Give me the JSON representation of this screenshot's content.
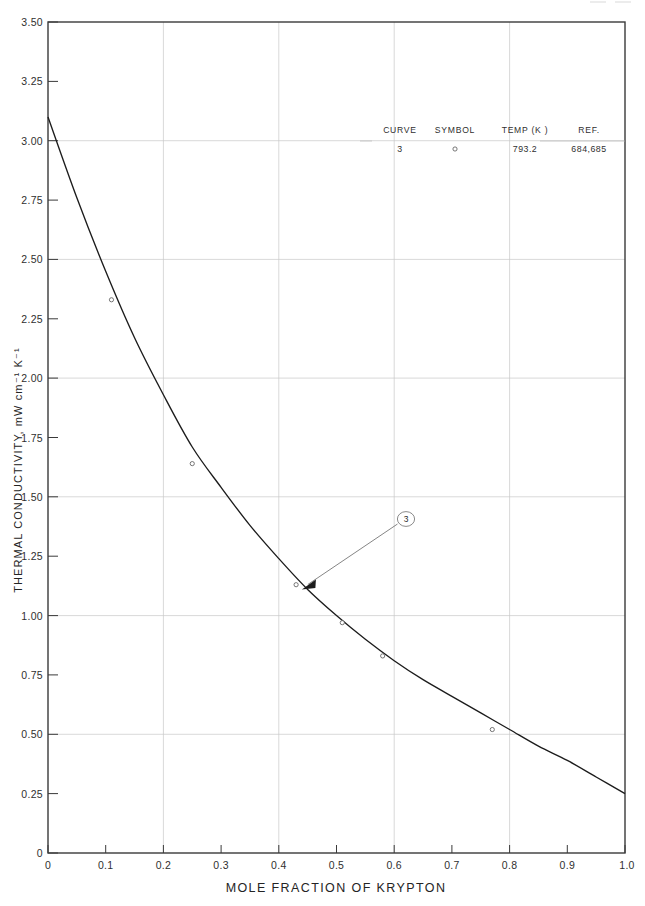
{
  "figure": {
    "background_color": "#ffffff",
    "curve_color": "#1c1c1c",
    "grid_color": "#c9c9c9",
    "axis_color": "#3a3a3a"
  },
  "axes": {
    "x_label": "MOLE  FRACTION  OF  KRYPTON",
    "y_label": "THERMAL CONDUCTIVITY, mW cm⁻¹ K⁻¹",
    "x_ticklabels": [
      "0",
      "0.1",
      "0.2",
      "0.3",
      "0.4",
      "0.5",
      "0.6",
      "0.7",
      "0.8",
      "0.9",
      "1.0"
    ],
    "y_ticklabels": [
      "0",
      "0.25",
      "0.50",
      "0.75",
      "1.00",
      "1.25",
      "1.50",
      "1.75",
      "2.00",
      "2.25",
      "2.50",
      "2.75",
      "3.00",
      "3.25",
      "3.50"
    ],
    "y_origin_label": "0",
    "x_origin_label": "0"
  },
  "legend": {
    "headers": [
      "CURVE",
      "SYMBOL",
      "TEMP (K )",
      "REF."
    ],
    "rows": [
      {
        "curve": "3",
        "symbol": "open-circle",
        "temp": "793.2",
        "ref": "684,685"
      }
    ]
  },
  "annotation": {
    "callout_label": "3"
  },
  "chart_data": {
    "type": "line",
    "title": "",
    "xlabel": "MOLE  FRACTION  OF  KRYPTON",
    "ylabel": "THERMAL CONDUCTIVITY, mW cm⁻¹ K⁻¹",
    "xlim": [
      0,
      1.0
    ],
    "ylim": [
      0,
      3.5
    ],
    "xticks": [
      0,
      0.1,
      0.2,
      0.3,
      0.4,
      0.5,
      0.6,
      0.7,
      0.8,
      0.9,
      1.0
    ],
    "yticks": [
      0,
      0.25,
      0.5,
      0.75,
      1.0,
      1.25,
      1.5,
      1.75,
      2.0,
      2.25,
      2.5,
      2.75,
      3.0,
      3.25,
      3.5
    ],
    "grid": true,
    "grid_x_interval": 0.2,
    "grid_y_interval": 0.5,
    "legend_position": "upper-right-inset",
    "series": [
      {
        "name": "Curve 3",
        "temperature_K": "793.2",
        "reference": "684,685",
        "symbol": "open-circle",
        "x": [
          0.0,
          0.05,
          0.1,
          0.15,
          0.2,
          0.25,
          0.3,
          0.35,
          0.4,
          0.45,
          0.5,
          0.55,
          0.6,
          0.65,
          0.7,
          0.75,
          0.8,
          0.85,
          0.9,
          0.95,
          1.0
        ],
        "values": [
          3.1,
          2.76,
          2.45,
          2.17,
          1.93,
          1.71,
          1.54,
          1.38,
          1.24,
          1.11,
          1.0,
          0.9,
          0.81,
          0.73,
          0.66,
          0.59,
          0.52,
          0.45,
          0.39,
          0.32,
          0.25
        ]
      }
    ],
    "data_points": [
      {
        "x": 0.11,
        "y": 2.33
      },
      {
        "x": 0.25,
        "y": 1.64
      },
      {
        "x": 0.43,
        "y": 1.13
      },
      {
        "x": 0.51,
        "y": 0.97
      },
      {
        "x": 0.58,
        "y": 0.83
      },
      {
        "x": 0.77,
        "y": 0.52
      }
    ],
    "annotations": [
      {
        "label": "3",
        "points_to_x": 0.44,
        "points_to_y": 1.11
      }
    ]
  }
}
